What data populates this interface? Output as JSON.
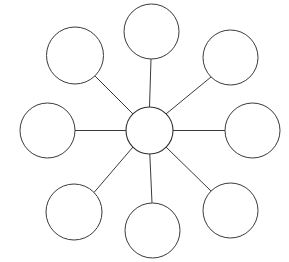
{
  "canvas": {
    "width": 289,
    "height": 262,
    "background_color": "#ffffff",
    "stroke_color": "#3a3a3a",
    "node_fill_color": "#ffffff"
  },
  "diagram": {
    "type": "radial-cluster-web",
    "title": "",
    "center_node": {
      "id": "center",
      "label": "",
      "cx": 149.5,
      "cy": 130.5,
      "r": 23.5
    },
    "satellite_nodes": [
      {
        "id": "node-n",
        "label": "",
        "position": "top",
        "angle_deg": 90,
        "cx": 151.5,
        "cy": 31.5,
        "r": 27.5
      },
      {
        "id": "node-ne",
        "label": "",
        "position": "top-right",
        "angle_deg": 45,
        "cx": 230.5,
        "cy": 57.5,
        "r": 27.5
      },
      {
        "id": "node-e",
        "label": "",
        "position": "right",
        "angle_deg": 0,
        "cx": 252.5,
        "cy": 130.5,
        "r": 27.5
      },
      {
        "id": "node-se",
        "label": "",
        "position": "bottom-right",
        "angle_deg": -45,
        "cx": 230.5,
        "cy": 210.5,
        "r": 27.5
      },
      {
        "id": "node-s",
        "label": "",
        "position": "bottom",
        "angle_deg": -90,
        "cx": 152.5,
        "cy": 230.5,
        "r": 27.5
      },
      {
        "id": "node-sw",
        "label": "",
        "position": "bottom-left",
        "angle_deg": -135,
        "cx": 74.0,
        "cy": 212.0,
        "r": 28.0
      },
      {
        "id": "node-w",
        "label": "",
        "position": "left",
        "angle_deg": 180,
        "cx": 47.5,
        "cy": 130.5,
        "r": 27.5
      },
      {
        "id": "node-nw",
        "label": "",
        "position": "top-left",
        "angle_deg": 135,
        "cx": 75.0,
        "cy": 55.5,
        "r": 28.5
      }
    ],
    "connectors": [
      {
        "id": "spoke-n",
        "from": "center",
        "to": "node-n",
        "x1": 149.5,
        "y1": 107.0,
        "x2": 151.0,
        "y2": 59.0
      },
      {
        "id": "spoke-ne",
        "from": "center",
        "to": "node-ne",
        "x1": 166.1,
        "y1": 113.9,
        "x2": 211.0,
        "y2": 77.0
      },
      {
        "id": "spoke-e",
        "from": "center",
        "to": "node-e",
        "x1": 173.0,
        "y1": 130.5,
        "x2": 225.0,
        "y2": 130.5
      },
      {
        "id": "spoke-se",
        "from": "center",
        "to": "node-se",
        "x1": 166.1,
        "y1": 147.1,
        "x2": 211.0,
        "y2": 191.0
      },
      {
        "id": "spoke-s",
        "from": "center",
        "to": "node-s",
        "x1": 149.8,
        "y1": 154.0,
        "x2": 152.0,
        "y2": 203.0
      },
      {
        "id": "spoke-sw",
        "from": "center",
        "to": "node-sw",
        "x1": 132.9,
        "y1": 147.1,
        "x2": 94.0,
        "y2": 192.5
      },
      {
        "id": "spoke-w",
        "from": "center",
        "to": "node-w",
        "x1": 126.0,
        "y1": 130.5,
        "x2": 75.0,
        "y2": 130.5
      },
      {
        "id": "spoke-nw",
        "from": "center",
        "to": "node-nw",
        "x1": 132.9,
        "y1": 113.9,
        "x2": 95.0,
        "y2": 76.0
      }
    ]
  }
}
